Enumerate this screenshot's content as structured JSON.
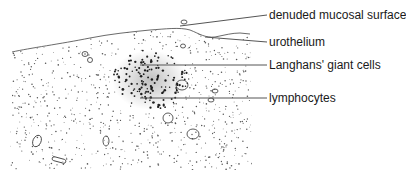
{
  "figure": {
    "labels": [
      {
        "id": "denuded",
        "text": "denuded mucosal surface",
        "x": 269,
        "y": 8
      },
      {
        "id": "urothelium",
        "text": "urothelium",
        "x": 269,
        "y": 35
      },
      {
        "id": "langhans",
        "text": "Langhans' giant cells",
        "x": 269,
        "y": 58
      },
      {
        "id": "lymphocytes",
        "text": "lymphocytes",
        "x": 269,
        "y": 91
      }
    ],
    "leader_lines": [
      {
        "id": "denuded",
        "x1": 180,
        "y1": 26,
        "x2": 267,
        "y2": 15
      },
      {
        "id": "urothelium",
        "x1": 205,
        "y1": 37,
        "x2": 267,
        "y2": 42
      },
      {
        "id": "langhans",
        "x1": 140,
        "y1": 65,
        "x2": 267,
        "y2": 65
      },
      {
        "id": "lymphocytes",
        "x1": 140,
        "y1": 98,
        "x2": 267,
        "y2": 98
      }
    ],
    "colors": {
      "ink": "#2a2a2a",
      "line": "#555555",
      "background": "#ffffff"
    }
  }
}
